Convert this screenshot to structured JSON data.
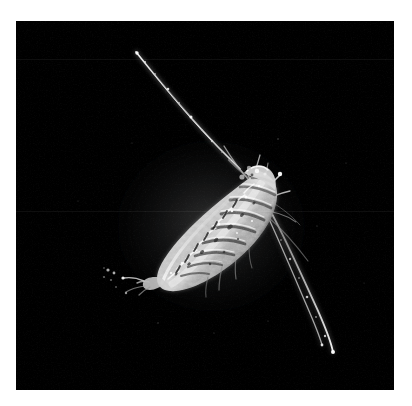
{
  "image": {
    "kind": "dark-field-plankton-micrograph",
    "subject_label": "copepod-specimen",
    "background_color": "#000000",
    "page_background_color": "#ffffff",
    "frame": {
      "x": 16,
      "y": 21,
      "width": 378,
      "height": 369
    },
    "caption": ""
  },
  "specimen": {
    "name": "copepod",
    "orientation_label": "head-upper-right-tail-lower-left",
    "body": {
      "highlight_color": "#e8e8e8",
      "midtone_color": "#b4b4b4",
      "shadow_color": "#3a3a3a",
      "head_point": {
        "x": 243,
        "y": 162
      },
      "tail_point": {
        "x": 146,
        "y": 268
      },
      "max_width_px": 62,
      "length_px": 145,
      "rotation_deg": -47,
      "segment_count": 9
    },
    "appendages": [
      {
        "label": "antenna-upper-left",
        "tip": {
          "x": 136,
          "y": 52
        },
        "base": {
          "x": 236,
          "y": 168
        },
        "brightness": "#c8c8c8",
        "thickness_px": 2
      },
      {
        "label": "antenna-lower-right-outer",
        "tip": {
          "x": 331,
          "y": 352
        },
        "base": {
          "x": 250,
          "y": 182
        },
        "brightness": "#d0d0d0",
        "thickness_px": 2
      },
      {
        "label": "antenna-lower-right-inner",
        "tip": {
          "x": 322,
          "y": 345
        },
        "base": {
          "x": 247,
          "y": 176
        },
        "brightness": "#9a9a9a",
        "thickness_px": 2
      },
      {
        "label": "setae-short-right",
        "tip": {
          "x": 279,
          "y": 173
        },
        "base": {
          "x": 252,
          "y": 196
        },
        "brightness": "#dcdcdc",
        "thickness_px": 2
      },
      {
        "label": "furcal-rami-tail",
        "tip": {
          "x": 112,
          "y": 262
        },
        "base": {
          "x": 150,
          "y": 266
        },
        "brightness": "#a0a0a0",
        "thickness_px": 2
      }
    ]
  },
  "chart_data": null
}
